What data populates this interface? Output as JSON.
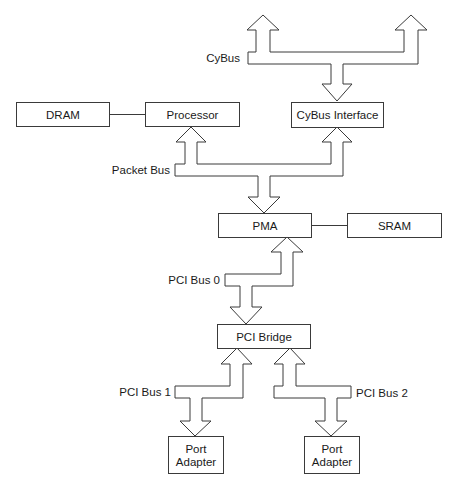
{
  "diagram": {
    "type": "block-diagram",
    "colors": {
      "background": "#ffffff",
      "stroke": "#3a3a3a",
      "text": "#1a1a1a"
    },
    "nodes": {
      "dram": "DRAM",
      "processor": "Processor",
      "cybus_interface": "CyBus Interface",
      "pma": "PMA",
      "sram": "SRAM",
      "pci_bridge": "PCI Bridge",
      "port_adapter_1": {
        "line1": "Port",
        "line2": "Adapter"
      },
      "port_adapter_2": {
        "line1": "Port",
        "line2": "Adapter"
      }
    },
    "buses": {
      "cybus": "CyBus",
      "packet_bus": "Packet Bus",
      "pci_bus_0": "PCI Bus 0",
      "pci_bus_1": "PCI Bus 1",
      "pci_bus_2": "PCI Bus 2"
    },
    "edges": [
      {
        "from": "DRAM",
        "to": "Processor",
        "kind": "line"
      },
      {
        "from": "PMA",
        "to": "SRAM",
        "kind": "line"
      },
      {
        "from": "CyBus",
        "to": "CyBus Interface",
        "kind": "bus-arrow"
      },
      {
        "from": "Packet Bus",
        "to": "Processor",
        "kind": "bus-arrow"
      },
      {
        "from": "Packet Bus",
        "to": "CyBus Interface",
        "kind": "bus-arrow"
      },
      {
        "from": "Packet Bus",
        "to": "PMA",
        "kind": "bus-arrow"
      },
      {
        "from": "PCI Bus 0",
        "to": "PMA",
        "kind": "bus-arrow"
      },
      {
        "from": "PCI Bus 0",
        "to": "PCI Bridge",
        "kind": "bus-arrow"
      },
      {
        "from": "PCI Bus 1",
        "to": "PCI Bridge",
        "kind": "bus-arrow"
      },
      {
        "from": "PCI Bus 1",
        "to": "Port Adapter",
        "kind": "bus-arrow"
      },
      {
        "from": "PCI Bus 2",
        "to": "PCI Bridge",
        "kind": "bus-arrow"
      },
      {
        "from": "PCI Bus 2",
        "to": "Port Adapter",
        "kind": "bus-arrow"
      }
    ]
  }
}
